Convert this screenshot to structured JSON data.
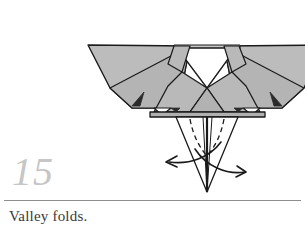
{
  "page": {
    "background_color": "#ffffff",
    "width": 305,
    "height": 231
  },
  "step": {
    "number": "15",
    "number_color": "#c6c6c6"
  },
  "caption": {
    "text": "Valley folds.",
    "color": "#3a3a3a",
    "rule_color": "#8e8e8e"
  },
  "diagram": {
    "title": "origami-folding-diagram",
    "colors": {
      "paper_fill": "#b9b9b9",
      "paper_fill_light": "#c4c4c4",
      "paper_fill_dark": "#aaaaaa",
      "paper_white": "#ffffff",
      "outline": "#1a1a1a",
      "accent_dark": "#2b2b2b",
      "fold_line": "#1a1a1a",
      "arrow": "#1a1a1a"
    },
    "parts": [
      {
        "name": "left-wing",
        "label": "Left wing"
      },
      {
        "name": "right-wing",
        "label": "Right wing"
      },
      {
        "name": "center-notch",
        "label": "Center notch"
      },
      {
        "name": "body-panel-left",
        "label": "Left body panel"
      },
      {
        "name": "body-panel-right",
        "label": "Right body panel"
      },
      {
        "name": "body-base-band",
        "label": "Body base band"
      },
      {
        "name": "bottom-point",
        "label": "Bottom point"
      }
    ],
    "fold_lines": [
      {
        "name": "valley-fold-left",
        "style": "dashed"
      },
      {
        "name": "valley-fold-right",
        "style": "dashed"
      }
    ],
    "arrows": [
      {
        "name": "fold-arrow-left",
        "direction": "left-outward"
      },
      {
        "name": "fold-arrow-right",
        "direction": "right-outward"
      }
    ]
  }
}
